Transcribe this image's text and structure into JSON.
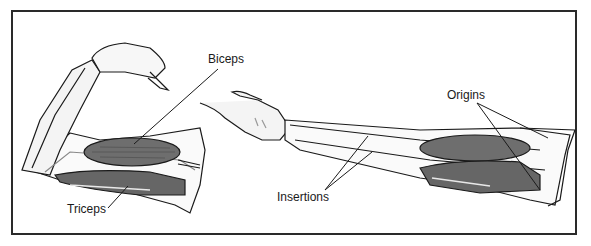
{
  "diagram": {
    "labels": {
      "biceps": "Biceps",
      "triceps": "Triceps",
      "insertions": "Insertions",
      "origins": "Origins"
    },
    "colors": {
      "frame": "#2a2a2a",
      "muscle": "#6e6e6e",
      "muscle_dark": "#4a4a4a",
      "bone": "#f2f2f2",
      "outline": "#1a1a1a"
    }
  }
}
